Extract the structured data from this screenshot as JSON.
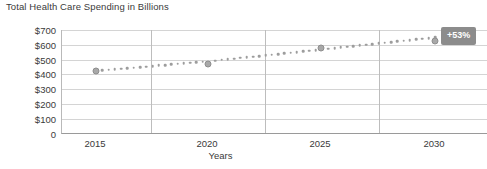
{
  "chart_data": {
    "type": "line",
    "title": "Total Health Care Spending in Billions",
    "xlabel": "Years",
    "ylabel": "",
    "x": [
      2015,
      2020,
      2025,
      2030
    ],
    "categories": [
      "2015",
      "2020",
      "2025",
      "2030"
    ],
    "series": [
      {
        "name": "Total Health Care Spending",
        "values": [
          425,
          490,
          570,
          650
        ],
        "style": "dotted",
        "color": "#9d9d9d"
      }
    ],
    "ytick_labels": [
      "$700",
      "$600",
      "$500",
      "$400",
      "$300",
      "$200",
      "$100",
      "0"
    ],
    "ytick_values": [
      700,
      600,
      500,
      400,
      300,
      200,
      100,
      0
    ],
    "xtick_labels": [
      "2015",
      "2020",
      "2025",
      "2030"
    ],
    "ylim": [
      0,
      700
    ],
    "xlim": [
      2013,
      2032
    ],
    "grid": "both",
    "legend": "none",
    "annotations": [
      {
        "name": "growth-badge",
        "text": "+53%",
        "color": "#8c8c8c",
        "text_color": "#ffffff"
      }
    ]
  },
  "axis": {
    "y_labels": [
      "$700",
      "$600",
      "$500",
      "$400",
      "$300",
      "$200",
      "$100",
      "0"
    ],
    "x_labels": [
      "2015",
      "2020",
      "2025",
      "2030"
    ],
    "x_title": "Years"
  },
  "badge": {
    "label": "+53%"
  },
  "header": {
    "title": "Total Health Care Spending in Billions"
  }
}
